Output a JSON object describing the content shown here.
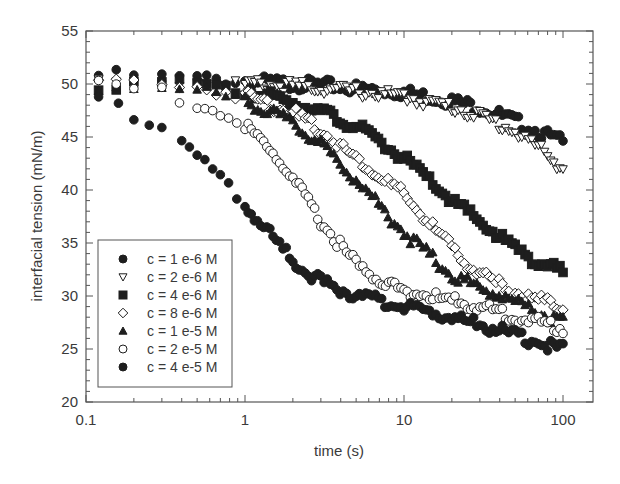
{
  "chart_data": {
    "type": "scatter",
    "title": "",
    "xlabel": "time (s)",
    "ylabel": "interfacial tension (mN/m)",
    "xscale": "log",
    "xlim": [
      0.1,
      150
    ],
    "ylim": [
      20,
      55
    ],
    "x_ticks": [
      "0.1",
      "1",
      "10",
      "100"
    ],
    "y_ticks": [
      "20",
      "25",
      "30",
      "35",
      "40",
      "45",
      "50",
      "55"
    ],
    "grid": false,
    "legend_position": "lower left (inside)",
    "series": [
      {
        "name": "c = 1 e-6 M",
        "marker": "filled-circle",
        "points": [
          [
            0.12,
            50.8
          ],
          [
            0.2,
            50.8
          ],
          [
            0.3,
            50.6
          ],
          [
            0.5,
            50.5
          ],
          [
            1,
            50.3
          ],
          [
            2,
            50.0
          ],
          [
            3,
            49.9
          ],
          [
            5,
            49.6
          ],
          [
            10,
            49.2
          ],
          [
            20,
            48.4
          ],
          [
            30,
            47.8
          ],
          [
            50,
            46.5
          ],
          [
            70,
            45.5
          ],
          [
            100,
            44.5
          ]
        ]
      },
      {
        "name": "c = 2 e-6 M",
        "marker": "open-down-triangle",
        "points": [
          [
            0.12,
            50.4
          ],
          [
            0.2,
            50.4
          ],
          [
            0.3,
            50.3
          ],
          [
            0.5,
            50.2
          ],
          [
            1,
            50.0
          ],
          [
            2,
            49.8
          ],
          [
            3,
            49.6
          ],
          [
            5,
            49.3
          ],
          [
            10,
            48.8
          ],
          [
            20,
            47.8
          ],
          [
            30,
            47.0
          ],
          [
            50,
            45.5
          ],
          [
            70,
            44.0
          ],
          [
            100,
            42.0
          ]
        ]
      },
      {
        "name": "c = 4 e-6 M",
        "marker": "filled-square",
        "points": [
          [
            0.12,
            50.0
          ],
          [
            0.2,
            50.0
          ],
          [
            0.3,
            50.0
          ],
          [
            0.5,
            49.8
          ],
          [
            1,
            49.3
          ],
          [
            2,
            48.3
          ],
          [
            3,
            47.4
          ],
          [
            5,
            46.0
          ],
          [
            10,
            43.0
          ],
          [
            20,
            39.0
          ],
          [
            30,
            37.0
          ],
          [
            50,
            34.5
          ],
          [
            70,
            33.2
          ],
          [
            100,
            32.2
          ]
        ]
      },
      {
        "name": "c = 8 e-6 M",
        "marker": "open-diamond",
        "points": [
          [
            0.12,
            50.2
          ],
          [
            0.2,
            50.2
          ],
          [
            0.3,
            50.0
          ],
          [
            0.5,
            49.8
          ],
          [
            1,
            49.0
          ],
          [
            2,
            47.3
          ],
          [
            3,
            45.6
          ],
          [
            5,
            43.0
          ],
          [
            10,
            39.5
          ],
          [
            20,
            34.5
          ],
          [
            30,
            32.0
          ],
          [
            50,
            30.3
          ],
          [
            70,
            29.6
          ],
          [
            100,
            29.0
          ]
        ]
      },
      {
        "name": "c = 1 e-5 M",
        "marker": "filled-triangle",
        "points": [
          [
            0.12,
            49.8
          ],
          [
            0.2,
            49.8
          ],
          [
            0.3,
            49.6
          ],
          [
            0.5,
            49.3
          ],
          [
            1,
            48.5
          ],
          [
            2,
            46.3
          ],
          [
            3,
            44.3
          ],
          [
            5,
            41.0
          ],
          [
            10,
            36.0
          ],
          [
            20,
            32.0
          ],
          [
            30,
            30.8
          ],
          [
            50,
            29.5
          ],
          [
            70,
            28.5
          ],
          [
            100,
            27.5
          ]
        ]
      },
      {
        "name": "c = 2 e-5 M",
        "marker": "open-circle",
        "points": [
          [
            0.12,
            50.3
          ],
          [
            0.2,
            49.5
          ],
          [
            0.3,
            49.2
          ],
          [
            0.5,
            48.2
          ],
          [
            0.7,
            47.2
          ],
          [
            1,
            46.0
          ],
          [
            1.5,
            43.5
          ],
          [
            2,
            41.0
          ],
          [
            3,
            37.0
          ],
          [
            5,
            33.0
          ],
          [
            7,
            31.5
          ],
          [
            10,
            30.5
          ],
          [
            20,
            29.5
          ],
          [
            30,
            29.0
          ],
          [
            50,
            28.0
          ],
          [
            70,
            27.5
          ],
          [
            100,
            27.0
          ]
        ]
      },
      {
        "name": "c = 4 e-5 M",
        "marker": "filled-circle",
        "points": [
          [
            0.12,
            48.8
          ],
          [
            0.16,
            48.3
          ],
          [
            0.2,
            47.2
          ],
          [
            0.25,
            46.7
          ],
          [
            0.3,
            46.0
          ],
          [
            0.4,
            44.6
          ],
          [
            0.5,
            43.2
          ],
          [
            0.7,
            41.0
          ],
          [
            1,
            38.5
          ],
          [
            1.5,
            35.5
          ],
          [
            2,
            33.3
          ],
          [
            3,
            31.3
          ],
          [
            5,
            30.0
          ],
          [
            10,
            29.0
          ],
          [
            20,
            28.0
          ],
          [
            30,
            27.3
          ],
          [
            50,
            26.3
          ],
          [
            70,
            25.6
          ],
          [
            100,
            25.0
          ]
        ]
      }
    ]
  },
  "legend": {
    "items": [
      {
        "label": "c = 1 e-6 M",
        "marker": "filled-circle"
      },
      {
        "label": "c = 2 e-6 M",
        "marker": "open-down-triangle"
      },
      {
        "label": "c = 4 e-6 M",
        "marker": "filled-square"
      },
      {
        "label": "c = 8 e-6 M",
        "marker": "open-diamond"
      },
      {
        "label": "c = 1 e-5 M",
        "marker": "filled-triangle"
      },
      {
        "label": "c = 2 e-5 M",
        "marker": "open-circle"
      },
      {
        "label": "c = 4 e-5 M",
        "marker": "filled-circle"
      }
    ]
  },
  "colors": {
    "ink": "#1e1e1e",
    "axis": "#555555",
    "background": "#ffffff"
  }
}
